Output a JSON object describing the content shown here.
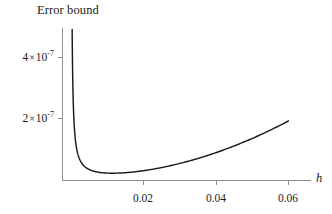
{
  "chart_data": {
    "type": "line",
    "title": "Error bound",
    "xlabel": "h",
    "ylabel": "",
    "xlim": [
      0.0,
      0.0658
    ],
    "ylim": [
      0.0,
      5.3e-07
    ],
    "grid": false,
    "legend": "none",
    "line_color": "#1a1a1a",
    "axis_color": "#8c8c8c",
    "background_color": "#ffffff",
    "xticks": [
      0.02,
      0.04,
      0.06
    ],
    "xtick_labels": [
      "0.02",
      "0.04",
      "0.06"
    ],
    "yticks": [
      2e-07,
      4e-07
    ],
    "ytick_labels": [
      "2 × 10",
      "4 × 10"
    ],
    "ytick_mantissas": [
      "2",
      "4"
    ],
    "ytick_exponents": [
      "-7",
      "-7"
    ],
    "ytick_base": "10",
    "times_symbol": "×",
    "annotations": [],
    "minimum": {
      "x": 0.0213,
      "y": 2.9e-08
    },
    "x": [
      0.00032,
      0.0004,
      0.0005,
      0.00065,
      0.00085,
      0.0011,
      0.0014,
      0.0018,
      0.0023,
      0.0029,
      0.0036,
      0.0044,
      0.0054,
      0.0065,
      0.0078,
      0.0092,
      0.0108,
      0.0125,
      0.0143,
      0.0162,
      0.0182,
      0.0202,
      0.0223,
      0.0244,
      0.0266,
      0.0288,
      0.031,
      0.0332,
      0.0355,
      0.0378,
      0.0401,
      0.0424,
      0.0447,
      0.047,
      0.0493,
      0.0516,
      0.0539,
      0.0562,
      0.0585,
      0.06
    ],
    "y": [
      4.92e-07,
      3.94e-07,
      3.16e-07,
      2.44e-07,
      1.87e-07,
      1.45e-07,
      1.15e-07,
      9.05e-08,
      7.18e-08,
      5.82e-08,
      4.79e-08,
      4.07e-08,
      3.56e-08,
      3.26e-08,
      3.05e-08,
      2.95e-08,
      2.9e-08,
      2.9e-08,
      2.94e-08,
      3.04e-08,
      3.19e-08,
      3.38e-08,
      3.64e-08,
      3.95e-08,
      4.33e-08,
      4.77e-08,
      5.26e-08,
      5.82e-08,
      6.51e-08,
      7.28e-08,
      8.13e-08,
      9.07e-08,
      1.01e-07,
      1.12e-07,
      1.24e-07,
      1.37e-07,
      1.51e-07,
      1.66e-07,
      1.82e-07,
      1.92e-07
    ]
  },
  "figure": {
    "title": "Error bound",
    "x_axis_label": "h",
    "y_tick_1": {
      "mantissa": "2",
      "times": "×",
      "base": "10",
      "exponent": "-7"
    },
    "y_tick_2": {
      "mantissa": "4",
      "times": "×",
      "base": "10",
      "exponent": "-7"
    },
    "x_tick_1": "0.02",
    "x_tick_2": "0.04",
    "x_tick_3": "0.06"
  }
}
